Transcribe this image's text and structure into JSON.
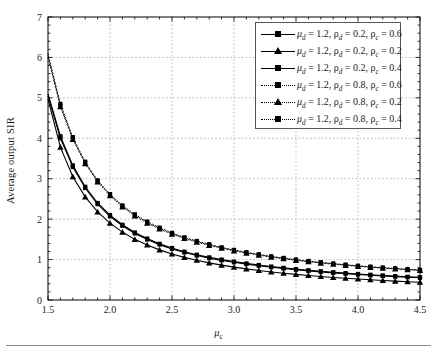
{
  "figure": {
    "xlabel": "μ",
    "xlabel_sub": "c",
    "ylabel": "Average output SIR"
  },
  "legend": {
    "entries": [
      {
        "mu_d": "1.2",
        "rho_d": "0.2",
        "rho_c": "0.6",
        "style": "solid",
        "marker": "square",
        "text": "μd = 1.2, ρd = 0.2, ρc = 0.6"
      },
      {
        "mu_d": "1.2",
        "rho_d": "0.2",
        "rho_c": "0.2",
        "style": "solid",
        "marker": "triangle",
        "text": "μd = 1.2, ρd = 0.2, ρc = 0.2"
      },
      {
        "mu_d": "1.2",
        "rho_d": "0.2",
        "rho_c": "0.4",
        "style": "solid",
        "marker": "square",
        "text": "μd = 1.2, ρd = 0.2, ρc = 0.4"
      },
      {
        "mu_d": "1.2",
        "rho_d": "0.8",
        "rho_c": "0.6",
        "style": "dotted",
        "marker": "square",
        "text": "μd = 1.2, ρd = 0.8, ρc = 0.6"
      },
      {
        "mu_d": "1.2",
        "rho_d": "0.8",
        "rho_c": "0.2",
        "style": "dotted",
        "marker": "triangle",
        "text": "μd = 1.2, ρd = 0.8, ρc = 0.2"
      },
      {
        "mu_d": "1.2",
        "rho_d": "0.8",
        "rho_c": "0.4",
        "style": "dotted",
        "marker": "square",
        "text": "μd = 1.2, ρd = 0.8, ρc = 0.4"
      }
    ]
  },
  "chart_data": {
    "type": "line",
    "title": "",
    "xlabel": "μ_c",
    "ylabel": "Average output SIR",
    "xlim": [
      1.5,
      4.5
    ],
    "ylim": [
      0,
      7
    ],
    "xticks": [
      1.5,
      2.0,
      2.5,
      3.0,
      3.5,
      4.0,
      4.5
    ],
    "xticklabels": [
      "1.5",
      "2.0",
      "2.5",
      "3.0",
      "3.5",
      "4.0",
      "4.5"
    ],
    "yticks": [
      0,
      1,
      2,
      3,
      4,
      5,
      6,
      7
    ],
    "yticklabels": [
      "0",
      "1",
      "2",
      "3",
      "4",
      "5",
      "6",
      "7"
    ],
    "grid": true,
    "legend_position": "upper right",
    "x": [
      1.5,
      1.6,
      1.7,
      1.8,
      1.9,
      2.0,
      2.1,
      2.2,
      2.3,
      2.4,
      2.5,
      2.6,
      2.7,
      2.8,
      2.9,
      3.0,
      3.1,
      3.2,
      3.3,
      3.4,
      3.5,
      3.6,
      3.7,
      3.8,
      3.9,
      4.0,
      4.1,
      4.2,
      4.3,
      4.4,
      4.5
    ],
    "series": [
      {
        "name": "μ_d = 1.2, ρ_d = 0.8, ρ_c = 0.6",
        "style": "dotted",
        "marker": "square",
        "values": [
          6.1,
          4.85,
          4.03,
          3.42,
          2.96,
          2.62,
          2.34,
          2.12,
          1.94,
          1.79,
          1.66,
          1.55,
          1.46,
          1.38,
          1.3,
          1.24,
          1.18,
          1.13,
          1.08,
          1.04,
          1.0,
          0.965,
          0.932,
          0.902,
          0.874,
          0.848,
          0.824,
          0.802,
          0.781,
          0.762,
          0.744
        ]
      },
      {
        "name": "μ_d = 1.2, ρ_d = 0.8, ρ_c = 0.4",
        "style": "dotted",
        "marker": "square",
        "values": [
          6.05,
          4.81,
          4.0,
          3.39,
          2.94,
          2.6,
          2.32,
          2.1,
          1.92,
          1.77,
          1.645,
          1.535,
          1.445,
          1.365,
          1.29,
          1.23,
          1.17,
          1.12,
          1.07,
          1.03,
          0.99,
          0.955,
          0.923,
          0.893,
          0.866,
          0.84,
          0.816,
          0.794,
          0.774,
          0.755,
          0.737
        ]
      },
      {
        "name": "μ_d = 1.2, ρ_d = 0.8, ρ_c = 0.2",
        "style": "dotted",
        "marker": "triangle",
        "values": [
          6.0,
          4.78,
          3.97,
          3.37,
          2.92,
          2.58,
          2.3,
          2.08,
          1.9,
          1.755,
          1.63,
          1.52,
          1.43,
          1.35,
          1.28,
          1.215,
          1.16,
          1.11,
          1.06,
          1.02,
          0.98,
          0.945,
          0.913,
          0.884,
          0.857,
          0.832,
          0.808,
          0.786,
          0.766,
          0.747,
          0.73
        ]
      },
      {
        "name": "μ_d = 1.2, ρ_d = 0.2, ρ_c = 0.6",
        "style": "solid",
        "marker": "square",
        "values": [
          5.1,
          4.05,
          3.33,
          2.8,
          2.4,
          2.1,
          1.86,
          1.67,
          1.52,
          1.39,
          1.285,
          1.195,
          1.12,
          1.055,
          1.0,
          0.95,
          0.905,
          0.865,
          0.828,
          0.795,
          0.764,
          0.736,
          0.71,
          0.686,
          0.664,
          0.644,
          0.625,
          0.607,
          0.591,
          0.575,
          0.561
        ]
      },
      {
        "name": "μ_d = 1.2, ρ_d = 0.2, ρ_c = 0.4",
        "style": "solid",
        "marker": "square",
        "values": [
          5.05,
          4.0,
          3.29,
          2.77,
          2.37,
          2.07,
          1.835,
          1.645,
          1.495,
          1.37,
          1.265,
          1.175,
          1.1,
          1.035,
          0.98,
          0.932,
          0.888,
          0.848,
          0.812,
          0.779,
          0.749,
          0.721,
          0.695,
          0.672,
          0.65,
          0.63,
          0.611,
          0.594,
          0.578,
          0.563,
          0.549
        ]
      },
      {
        "name": "μ_d = 1.2, ρ_d = 0.2, ρ_c = 0.2",
        "style": "solid",
        "marker": "triangle",
        "values": [
          4.97,
          3.78,
          3.05,
          2.55,
          2.18,
          1.9,
          1.68,
          1.5,
          1.36,
          1.24,
          1.14,
          1.055,
          0.982,
          0.918,
          0.862,
          0.813,
          0.769,
          0.73,
          0.694,
          0.662,
          0.633,
          0.606,
          0.581,
          0.558,
          0.537,
          0.518,
          0.5,
          0.483,
          0.467,
          0.452,
          0.438
        ]
      }
    ]
  }
}
